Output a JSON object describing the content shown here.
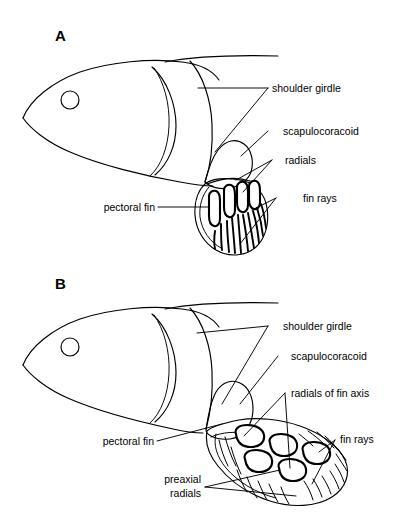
{
  "figure": {
    "background_color": "#ffffff",
    "line_color": "#000000",
    "panels": [
      {
        "letter": "A",
        "description": "Ray-finned fish pectoral fin with short radials and long fin rays",
        "labels": {
          "shoulder_girdle": "shoulder girdle",
          "scapulocoracoid": "scapulocoracoid",
          "radials": "radials",
          "fin_rays": "fin rays",
          "pectoral_fin": "pectoral fin"
        }
      },
      {
        "letter": "B",
        "description": "Lobe-finned fish pectoral fin with a jointed fin axis and preaxial radials",
        "labels": {
          "shoulder_girdle": "shoulder girdle",
          "scapulocoracoid": "scapulocoracoid",
          "radials_of_fin_axis": "radials of fin axis",
          "fin_rays": "fin rays",
          "pectoral_fin": "pectoral fin",
          "preaxial_radials_line1": "preaxial",
          "preaxial_radials_line2": "radials"
        }
      }
    ]
  }
}
